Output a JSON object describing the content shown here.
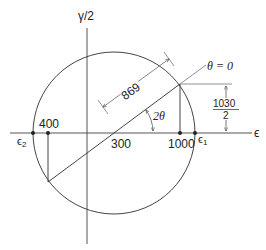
{
  "diagram": {
    "axes": {
      "vertical_label": "γ/2",
      "horizontal_label": "ϵ"
    },
    "labels": {
      "center": "300",
      "left_point": "400",
      "right_point": "1000",
      "epsilon_1": "ϵ",
      "epsilon_1_sub": "1",
      "epsilon_2": "ϵ",
      "epsilon_2_sub": "2",
      "radius": "869",
      "angle": "2θ",
      "reference_line": "θ = 0",
      "shear_numerator": "1030",
      "shear_denominator": "2"
    },
    "colors": {
      "line": "#333333",
      "light_line": "#777777",
      "background": "#ffffff"
    }
  }
}
